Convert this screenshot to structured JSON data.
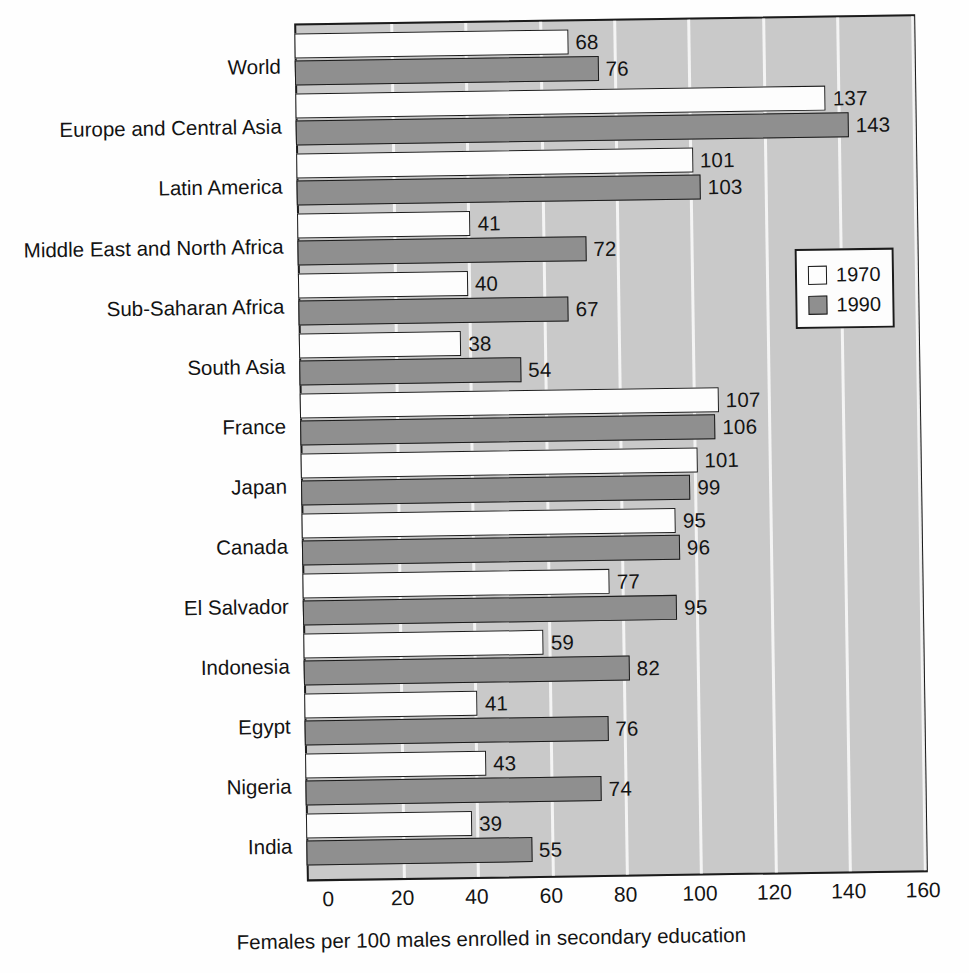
{
  "chart_data": {
    "type": "bar",
    "orientation": "horizontal",
    "title": "",
    "xlabel": "Females per 100 males enrolled in secondary education",
    "ylabel": "",
    "xlim": [
      0,
      160
    ],
    "xticks": [
      0,
      20,
      40,
      60,
      80,
      100,
      120,
      140,
      160
    ],
    "grid": true,
    "legend_position": "right-upper",
    "categories": [
      "World",
      "Europe and Central Asia",
      "Latin America",
      "Middle East and North Africa",
      "Sub-Saharan Africa",
      "South Asia",
      "France",
      "Japan",
      "Canada",
      "El Salvador",
      "Indonesia",
      "Egypt",
      "Nigeria",
      "India"
    ],
    "series": [
      {
        "name": "1970",
        "color": "#fdfdfd",
        "values": [
          68,
          137,
          101,
          41,
          40,
          38,
          107,
          101,
          95,
          77,
          59,
          41,
          43,
          39
        ]
      },
      {
        "name": "1990",
        "color": "#8f8f8f",
        "values": [
          76,
          143,
          103,
          72,
          67,
          54,
          106,
          99,
          96,
          95,
          82,
          76,
          74,
          55
        ]
      }
    ]
  },
  "legend": {
    "entries": [
      {
        "label": "1970"
      },
      {
        "label": "1990"
      }
    ]
  },
  "axis": {
    "x_title": "Females per 100 males enrolled in secondary education",
    "tick_labels": [
      "0",
      "20",
      "40",
      "60",
      "80",
      "100",
      "120",
      "140",
      "160"
    ]
  },
  "colors": {
    "plot_background": "#c9c9c9",
    "gridline": "#f7f7f7",
    "bar_1970": "#fdfdfd",
    "bar_1990": "#8f8f8f",
    "outline": "#1b1b1b",
    "text": "#141414"
  }
}
